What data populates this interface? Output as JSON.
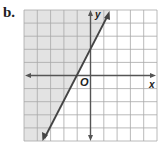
{
  "figure": {
    "part_label": "b.",
    "x_axis_label": "x",
    "y_axis_label": "y",
    "origin_label": "O",
    "grid": {
      "x_min": -5,
      "x_max": 5,
      "y_min": -5,
      "y_max": 5,
      "cell_px": 13.3
    },
    "boundary_line": {
      "equation": "y = 2x + 2",
      "style": "solid",
      "slope": 2,
      "intercept": 2
    },
    "shaded_region": "above/left of line (y > 2x + 2)",
    "colors": {
      "shade": "#e0e0e0",
      "grid": "#9a9a9a",
      "axis": "#555555",
      "line": "#444444"
    }
  }
}
